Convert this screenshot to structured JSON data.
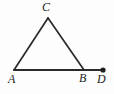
{
  "figure": {
    "kind": "geometry-diagram",
    "background_color": "#fdfdfd",
    "stroke_color": "#2b2b2b",
    "label_color": "#222222",
    "stroke_width": 1.8,
    "canvas": {
      "width": 114,
      "height": 94
    },
    "points": {
      "A": {
        "label": "A",
        "x": 14,
        "y": 70
      },
      "B": {
        "label": "B",
        "x": 84,
        "y": 70
      },
      "C": {
        "label": "C",
        "x": 48,
        "y": 18
      },
      "D": {
        "label": "D",
        "x": 103,
        "y": 70
      }
    },
    "segments": [
      {
        "name": "segment-AC",
        "from": "A",
        "to": "C"
      },
      {
        "name": "segment-CB",
        "from": "C",
        "to": "B"
      },
      {
        "name": "segment-AD",
        "from": "A",
        "to": "D"
      }
    ],
    "markers": [
      {
        "name": "point-marker-D",
        "at": "D",
        "style": "filled-dot",
        "radius": 2.6
      }
    ],
    "labels": {
      "A": "A",
      "B": "B",
      "C": "C",
      "D": "D"
    }
  }
}
